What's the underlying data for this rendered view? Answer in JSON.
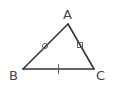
{
  "diagram": {
    "type": "triangle",
    "vertices": [
      {
        "label": "A",
        "x": 68,
        "y": 24
      },
      {
        "label": "B",
        "x": 23,
        "y": 69
      },
      {
        "label": "C",
        "x": 94,
        "y": 69
      }
    ],
    "labels": {
      "A": "A",
      "B": "B",
      "C": "C"
    },
    "side_markers": {
      "AB": "circle",
      "AC": "square",
      "BC": "tick"
    },
    "colors": {
      "stroke": "#333333",
      "label": "#444444",
      "background": "#ffffff"
    }
  }
}
